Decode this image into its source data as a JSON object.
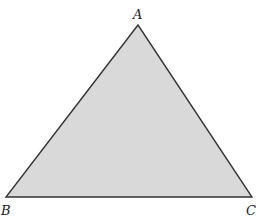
{
  "figure": {
    "type": "triangle",
    "fill_color": "#d9d9d9",
    "stroke_color": "#333333",
    "vertices": [
      {
        "label": "A",
        "x": 138,
        "y": 25
      },
      {
        "label": "B",
        "x": 6,
        "y": 197
      },
      {
        "label": "C",
        "x": 252,
        "y": 197
      }
    ]
  }
}
